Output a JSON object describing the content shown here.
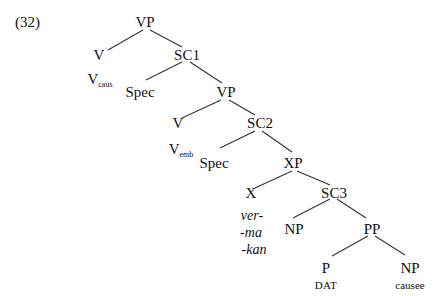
{
  "example_number": "(32)",
  "tree": {
    "root": {
      "label": "VP"
    },
    "v_caus": {
      "label": "V",
      "gloss_base": "V",
      "gloss_sub": "caus"
    },
    "sc1": {
      "label": "SC1"
    },
    "spec1": {
      "label": "Spec"
    },
    "vp2": {
      "label": "VP"
    },
    "v_emb": {
      "label": "V",
      "gloss_base": "V",
      "gloss_sub": "emb"
    },
    "sc2": {
      "label": "SC2"
    },
    "spec2": {
      "label": "Spec"
    },
    "xp": {
      "label": "XP"
    },
    "x": {
      "label": "X",
      "morphemes": [
        "ver-",
        "-ma",
        "-kan"
      ]
    },
    "sc3": {
      "label": "SC3"
    },
    "np1": {
      "label": "NP"
    },
    "pp": {
      "label": "PP"
    },
    "p": {
      "label": "P",
      "gloss": "DAT"
    },
    "np2": {
      "label": "NP",
      "gloss": "causee"
    }
  }
}
